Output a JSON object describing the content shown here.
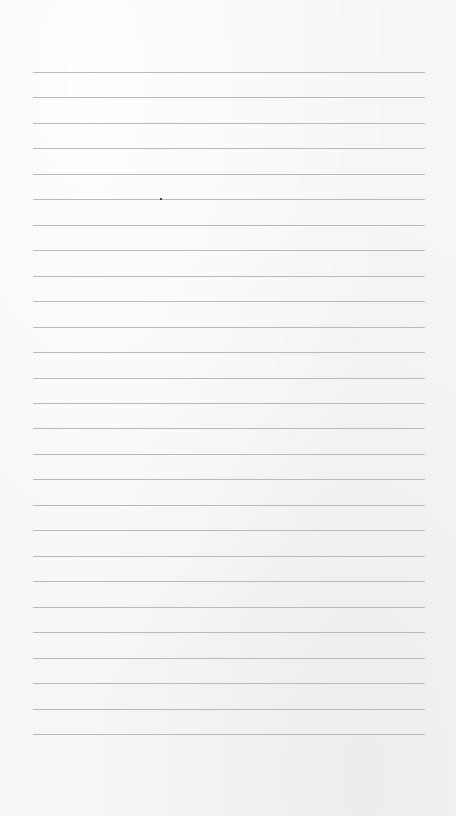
{
  "page": {
    "type": "lined-paper",
    "background_color": "#f6f6f5",
    "line_color": "#b9b9b9",
    "line_count": 27,
    "first_line_y": 72,
    "last_line_y": 734,
    "line_left_x": 33,
    "line_right_x": 425,
    "content_text": ""
  }
}
